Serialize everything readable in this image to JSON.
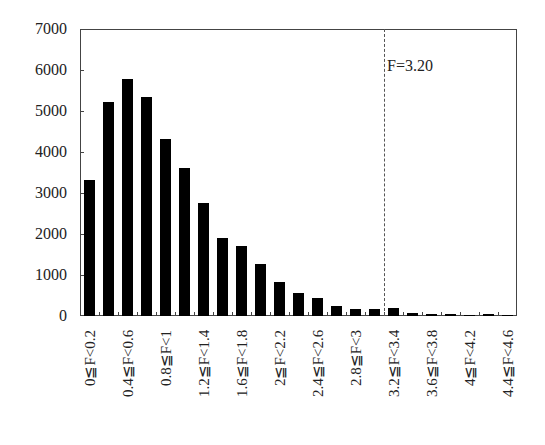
{
  "chart_data": {
    "type": "bar",
    "title": "",
    "xlabel": "",
    "ylabel": "",
    "ylim": [
      0,
      7000
    ],
    "yticks": [
      0,
      1000,
      2000,
      3000,
      4000,
      5000,
      6000,
      7000
    ],
    "grid": false,
    "legend": null,
    "categories": [
      "0≦F<0.2",
      "0.2≦F<0.4",
      "0.4≦F<0.6",
      "0.6≦F<0.8",
      "0.8≦F<1",
      "1≦F<1.2",
      "1.2≦F<1.4",
      "1.4≦F<1.6",
      "1.6≦F<1.8",
      "1.8≦F<2",
      "2≦F<2.2",
      "2.2≦F<2.4",
      "2.4≦F<2.6",
      "2.6≦F<2.8",
      "2.8≦F<3",
      "3≦F<3.2",
      "3.2≦F<3.4",
      "3.4≦F<3.6",
      "3.6≦F<3.8",
      "3.8≦F<4",
      "4≦F<4.2",
      "4.2≦F<4.4",
      "4.4≦F<4.6"
    ],
    "visible_tick_labels": [
      "0≦F<0.2",
      "0.4≦F<0.6",
      "0.8≦F<1",
      "1.2≦F<1.4",
      "1.6≦F<1.8",
      "2≦F<2.2",
      "2.4≦F<2.6",
      "2.8≦F<3",
      "3.2≦F<3.4",
      "3.6≦F<3.8",
      "4≦F<4.2",
      "4.4≦F<4.6"
    ],
    "values": [
      3320,
      5220,
      5780,
      5340,
      4320,
      3610,
      2760,
      1900,
      1710,
      1270,
      830,
      560,
      440,
      250,
      170,
      170,
      190,
      70,
      50,
      50,
      30,
      50,
      30
    ],
    "annotations": [
      {
        "type": "vertical-dashed-line",
        "x": 3.2,
        "label": "F=3.20"
      }
    ]
  },
  "annotation_label": "F=3.20"
}
